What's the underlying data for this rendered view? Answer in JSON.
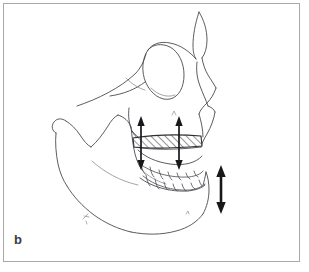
{
  "figure": {
    "panel_label": "b",
    "caption_visible": false,
    "background_color": "#ffffff",
    "frame_color": "#a9a9ac",
    "line_color": "#4a4a50",
    "arrow_color": "#18181b",
    "hatch_color": "#2e2e33",
    "type": "line-drawing"
  },
  "annotations": {
    "osteotomy_band": {
      "name": "le-fort-i-osteotomy-segment",
      "fill": "diagonal-hatch",
      "x": 133,
      "y": 137,
      "width": 68,
      "height": 9
    },
    "arrows": [
      {
        "name": "maxilla-vertical-arrow-posterior",
        "style": "double-headed",
        "orientation": "vertical",
        "weight": "thin",
        "x": 141,
        "y_top": 117,
        "y_bottom": 169
      },
      {
        "name": "maxilla-vertical-arrow-anterior",
        "style": "double-headed",
        "orientation": "vertical",
        "weight": "thin",
        "x": 179,
        "y_top": 117,
        "y_bottom": 169
      },
      {
        "name": "mandible-autorotation-arrow",
        "style": "double-headed",
        "orientation": "vertical",
        "weight": "thick",
        "x": 221,
        "y_top": 166,
        "y_bottom": 213
      }
    ],
    "pencil_marks": [
      {
        "name": "pencil-mark-mandible-body",
        "x": 85,
        "y": 217
      },
      {
        "name": "pencil-mark-maxilla",
        "x": 174,
        "y": 113
      },
      {
        "name": "pencil-mark-mental",
        "x": 187,
        "y": 213
      }
    ]
  }
}
